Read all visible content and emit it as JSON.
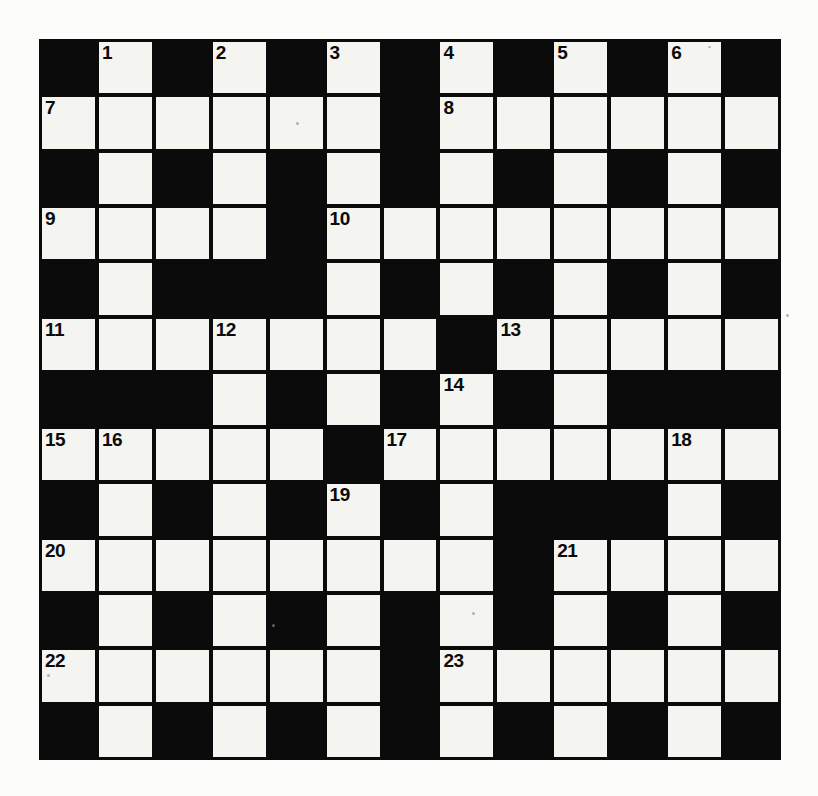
{
  "puzzle": {
    "type": "crossword-grid",
    "rows": 13,
    "columns": 13,
    "cell_colors": {
      "white": "#f4f4f0",
      "block": "#0b0b0b",
      "page": "#fcfcfa"
    },
    "grid": [
      [
        "block",
        "white",
        "block",
        "white",
        "block",
        "white",
        "block",
        "white",
        "block",
        "white",
        "block",
        "white",
        "block"
      ],
      [
        "white",
        "white",
        "white",
        "white",
        "white",
        "white",
        "block",
        "white",
        "white",
        "white",
        "white",
        "white",
        "white"
      ],
      [
        "block",
        "white",
        "block",
        "white",
        "block",
        "white",
        "block",
        "white",
        "block",
        "white",
        "block",
        "white",
        "block"
      ],
      [
        "white",
        "white",
        "white",
        "white",
        "block",
        "white",
        "white",
        "white",
        "white",
        "white",
        "white",
        "white",
        "white"
      ],
      [
        "block",
        "white",
        "block",
        "block",
        "block",
        "white",
        "block",
        "white",
        "block",
        "white",
        "block",
        "white",
        "block"
      ],
      [
        "white",
        "white",
        "white",
        "white",
        "white",
        "white",
        "white",
        "block",
        "white",
        "white",
        "white",
        "white",
        "white"
      ],
      [
        "block",
        "block",
        "block",
        "white",
        "block",
        "white",
        "block",
        "white",
        "block",
        "white",
        "block",
        "block",
        "block"
      ],
      [
        "white",
        "white",
        "white",
        "white",
        "white",
        "block",
        "white",
        "white",
        "white",
        "white",
        "white",
        "white",
        "white"
      ],
      [
        "block",
        "white",
        "block",
        "white",
        "block",
        "white",
        "block",
        "white",
        "block",
        "block",
        "block",
        "white",
        "block"
      ],
      [
        "white",
        "white",
        "white",
        "white",
        "white",
        "white",
        "white",
        "white",
        "block",
        "white",
        "white",
        "white",
        "white"
      ],
      [
        "block",
        "white",
        "block",
        "white",
        "block",
        "white",
        "block",
        "white",
        "block",
        "white",
        "block",
        "white",
        "block"
      ],
      [
        "white",
        "white",
        "white",
        "white",
        "white",
        "white",
        "block",
        "white",
        "white",
        "white",
        "white",
        "white",
        "white"
      ],
      [
        "block",
        "white",
        "block",
        "white",
        "block",
        "white",
        "block",
        "white",
        "block",
        "white",
        "block",
        "white",
        "block"
      ]
    ],
    "numbers": [
      {
        "row": 0,
        "col": 1,
        "label": "1"
      },
      {
        "row": 0,
        "col": 3,
        "label": "2"
      },
      {
        "row": 0,
        "col": 5,
        "label": "3"
      },
      {
        "row": 0,
        "col": 7,
        "label": "4"
      },
      {
        "row": 0,
        "col": 9,
        "label": "5"
      },
      {
        "row": 0,
        "col": 11,
        "label": "6"
      },
      {
        "row": 1,
        "col": 0,
        "label": "7"
      },
      {
        "row": 1,
        "col": 7,
        "label": "8"
      },
      {
        "row": 3,
        "col": 0,
        "label": "9"
      },
      {
        "row": 3,
        "col": 5,
        "label": "10"
      },
      {
        "row": 5,
        "col": 0,
        "label": "11"
      },
      {
        "row": 5,
        "col": 3,
        "label": "12"
      },
      {
        "row": 5,
        "col": 8,
        "label": "13"
      },
      {
        "row": 6,
        "col": 7,
        "label": "14"
      },
      {
        "row": 7,
        "col": 0,
        "label": "15"
      },
      {
        "row": 7,
        "col": 1,
        "label": "16"
      },
      {
        "row": 7,
        "col": 6,
        "label": "17"
      },
      {
        "row": 7,
        "col": 11,
        "label": "18"
      },
      {
        "row": 8,
        "col": 5,
        "label": "19"
      },
      {
        "row": 9,
        "col": 0,
        "label": "20"
      },
      {
        "row": 9,
        "col": 9,
        "label": "21"
      },
      {
        "row": 11,
        "col": 0,
        "label": "22"
      },
      {
        "row": 11,
        "col": 7,
        "label": "23"
      }
    ]
  }
}
